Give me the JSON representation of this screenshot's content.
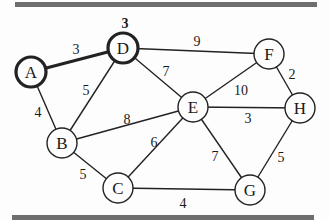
{
  "diagram": {
    "type": "weighted-undirected-graph",
    "bars": {
      "color": "#6e6e6e"
    },
    "nodes": [
      {
        "id": "A",
        "label": "A",
        "x": 31,
        "y": 72,
        "highlighted": true
      },
      {
        "id": "D",
        "label": "D",
        "x": 123,
        "y": 48,
        "highlighted": true,
        "distance": "3"
      },
      {
        "id": "F",
        "label": "F",
        "x": 269,
        "y": 54,
        "highlighted": false
      },
      {
        "id": "H",
        "label": "H",
        "x": 300,
        "y": 108,
        "highlighted": false
      },
      {
        "id": "E",
        "label": "E",
        "x": 193,
        "y": 107,
        "highlighted": false
      },
      {
        "id": "B",
        "label": "B",
        "x": 62,
        "y": 143,
        "highlighted": false
      },
      {
        "id": "C",
        "label": "C",
        "x": 118,
        "y": 188,
        "highlighted": false
      },
      {
        "id": "G",
        "label": "G",
        "x": 250,
        "y": 190,
        "highlighted": false
      }
    ],
    "edges": [
      {
        "from": "A",
        "to": "D",
        "weight": "3",
        "highlighted": true,
        "lx": 76,
        "ly": 54
      },
      {
        "from": "A",
        "to": "B",
        "weight": "4",
        "highlighted": false,
        "lx": 38,
        "ly": 117
      },
      {
        "from": "D",
        "to": "B",
        "weight": "5",
        "highlighted": false,
        "lx": 86,
        "ly": 95
      },
      {
        "from": "D",
        "to": "F",
        "weight": "9",
        "highlighted": false,
        "lx": 197,
        "ly": 46
      },
      {
        "from": "D",
        "to": "E",
        "weight": "7",
        "highlighted": false,
        "lx": 166,
        "ly": 76
      },
      {
        "from": "F",
        "to": "E",
        "weight": "10",
        "highlighted": false,
        "lx": 241,
        "ly": 95
      },
      {
        "from": "F",
        "to": "H",
        "weight": "2",
        "highlighted": false,
        "lx": 292,
        "ly": 79
      },
      {
        "from": "E",
        "to": "H",
        "weight": "3",
        "highlighted": false,
        "lx": 248,
        "ly": 123
      },
      {
        "from": "B",
        "to": "E",
        "weight": "8",
        "highlighted": false,
        "lx": 127,
        "ly": 124
      },
      {
        "from": "B",
        "to": "C",
        "weight": "5",
        "highlighted": false,
        "lx": 83,
        "ly": 179
      },
      {
        "from": "E",
        "to": "C",
        "weight": "6",
        "highlighted": false,
        "lx": 154,
        "ly": 147
      },
      {
        "from": "E",
        "to": "G",
        "weight": "7",
        "highlighted": false,
        "lx": 215,
        "ly": 161
      },
      {
        "from": "H",
        "to": "G",
        "weight": "5",
        "highlighted": false,
        "lx": 281,
        "ly": 162
      },
      {
        "from": "C",
        "to": "G",
        "weight": "4",
        "highlighted": false,
        "lx": 183,
        "ly": 208
      }
    ]
  }
}
